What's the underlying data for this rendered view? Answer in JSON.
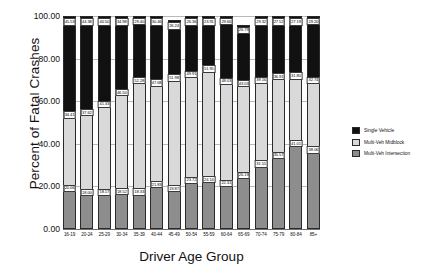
{
  "chart_data": {
    "type": "bar",
    "stacked": true,
    "title": "",
    "xlabel": "Driver Age Group",
    "ylabel": "Percent of Fatal Crashes",
    "ylim": [
      0,
      100
    ],
    "yticks": [
      "0.00",
      "20.00",
      "40.00",
      "60.00",
      "80.00",
      "100.00"
    ],
    "ytick_values": [
      0,
      20,
      40,
      60,
      80,
      100
    ],
    "grid": true,
    "legend_position": "right",
    "categories": [
      "16-19",
      "20-24",
      "25-29",
      "30-34",
      "35-39",
      "40-44",
      "45-49",
      "50-54",
      "55-59",
      "60-64",
      "65-69",
      "70-74",
      "75-79",
      "80-84",
      "85+"
    ],
    "series": [
      {
        "name": "Single Vehicle",
        "color": "#111111",
        "values": [
          45.53,
          44.38,
          40.5,
          34.98,
          29.4,
          30.46,
          26.24,
          26.36,
          23.91,
          29.66,
          26.79,
          29.32,
          27.52,
          27.19,
          29.2
        ],
        "labels": [
          "45.53",
          "44.38",
          "40.50",
          "34.98",
          "29.40",
          "30.46",
          "26.24",
          "26.36",
          "23.91",
          "29.66",
          "26.79",
          "29.32",
          "27.52",
          "27.19",
          "29.20"
        ]
      },
      {
        "name": "Multi-Veh Midblock",
        "color": "#d9d9d9",
        "values": [
          34.41,
          37.62,
          41.33,
          46.5,
          52.28,
          47.68,
          51.98,
          49.91,
          51.95,
          48.03,
          43.03,
          39.16,
          36.91,
          31.8,
          32.74
        ],
        "labels": [
          "34.41",
          "37.62",
          "41.33",
          "46.50",
          "52.28",
          "47.68",
          "51.98",
          "49.91",
          "51.95",
          "48.03",
          "43.03",
          "39.16",
          "36.91",
          "31.80",
          "32.74"
        ]
      },
      {
        "name": "Multi-Veh Intersection",
        "color": "#8d8d8d",
        "values": [
          20.06,
          18.0,
          18.17,
          18.52,
          18.33,
          21.83,
          19.87,
          23.72,
          24.14,
          22.31,
          26.19,
          31.51,
          35.57,
          41.01,
          38.06
        ],
        "labels": [
          "20.06",
          "18.00",
          "18.17",
          "18.52",
          "18.33",
          "21.83",
          "19.87",
          "23.72",
          "24.14",
          "22.31",
          "26.19",
          "31.51",
          "35.57",
          "41.01",
          "38.06"
        ]
      }
    ]
  },
  "axes": {
    "y_title": "Percent of Fatal Crashes",
    "x_title": "Driver Age Group"
  },
  "legend": {
    "items": [
      {
        "label": "Single Vehicle",
        "color": "#111111"
      },
      {
        "label": "Multi-Veh Midblock",
        "color": "#d9d9d9"
      },
      {
        "label": "Multi-Veh Intersection",
        "color": "#8d8d8d"
      }
    ]
  }
}
